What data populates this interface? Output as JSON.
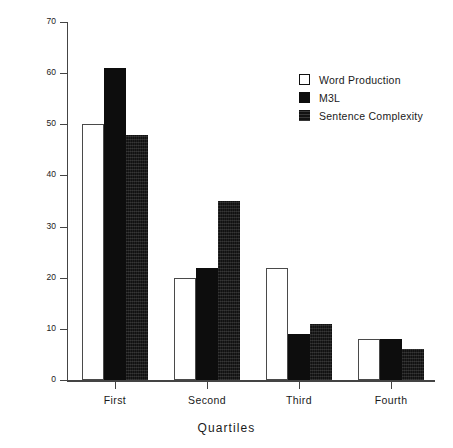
{
  "chart_data": {
    "type": "bar",
    "title": "",
    "xlabel": "Quartiles",
    "ylabel": "Percent of Sample",
    "categories": [
      "First",
      "Second",
      "Third",
      "Fourth"
    ],
    "series": [
      {
        "name": "Word Production",
        "swatch": "open-white",
        "color": "#ffffff",
        "values": [
          50,
          20,
          22,
          8
        ]
      },
      {
        "name": "M3L",
        "swatch": "solid-black",
        "color": "#0d0d0d",
        "values": [
          61,
          22,
          9,
          8
        ]
      },
      {
        "name": "Sentence Complexity",
        "swatch": "textured-black",
        "color": "#111111",
        "values": [
          48,
          35,
          11,
          6
        ]
      }
    ],
    "ylim": [
      0,
      70
    ],
    "yticks": [
      0,
      10,
      20,
      30,
      40,
      50,
      60,
      70
    ],
    "ytick_labels": [
      "0",
      "10",
      "20",
      "30",
      "40",
      "50",
      "60",
      "70"
    ],
    "grid": false,
    "legend_position": "top-right"
  }
}
